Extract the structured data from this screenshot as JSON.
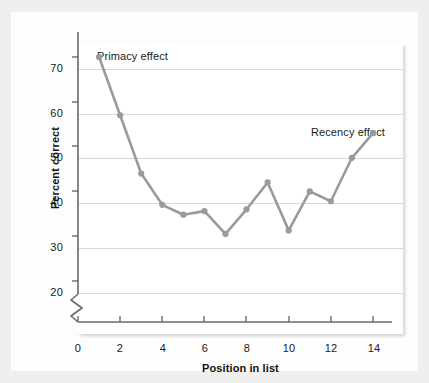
{
  "chart_data": {
    "type": "line",
    "title": "",
    "xlabel": "Position in list",
    "ylabel": "Percent correct",
    "x": [
      1,
      2,
      3,
      4,
      5,
      6,
      7,
      8,
      9,
      10,
      11,
      12,
      13,
      14
    ],
    "values": [
      70.0,
      57.0,
      44.0,
      37.0,
      34.8,
      35.6,
      30.5,
      36.0,
      42.0,
      31.3,
      40.0,
      37.8,
      47.5,
      53.0
    ],
    "series": [
      {
        "name": "Percent correct",
        "values": [
          70.0,
          57.0,
          44.0,
          37.0,
          34.8,
          35.6,
          30.5,
          36.0,
          42.0,
          31.3,
          40.0,
          37.8,
          47.5,
          53.0
        ]
      }
    ],
    "xlim": [
      0,
      15
    ],
    "ylim": [
      15,
      74
    ],
    "xticks": [
      0,
      2,
      4,
      6,
      8,
      10,
      12,
      14
    ],
    "yticks": [
      20,
      30,
      40,
      50,
      60,
      70
    ],
    "xtick_labels": [
      "0",
      "2",
      "4",
      "6",
      "8",
      "10",
      "12",
      "14"
    ],
    "ytick_labels": [
      "20",
      "30",
      "40",
      "50",
      "60",
      "70"
    ],
    "grid": true,
    "grid_axis": "y",
    "legend": false,
    "y_axis_break": true,
    "annotations": [
      {
        "text": "Primacy effect",
        "x": 1,
        "y": 72
      },
      {
        "text": "Recency effect",
        "x": 13,
        "y": 56
      }
    ],
    "line_color": "#9a9a9a",
    "marker_color": "#9a9a9a",
    "marker": "circle",
    "grid_color": "#d8d8d8",
    "axis_color": "#6b6b6b",
    "background_color": "#ffffff",
    "figure_background_color": "#efefef"
  }
}
